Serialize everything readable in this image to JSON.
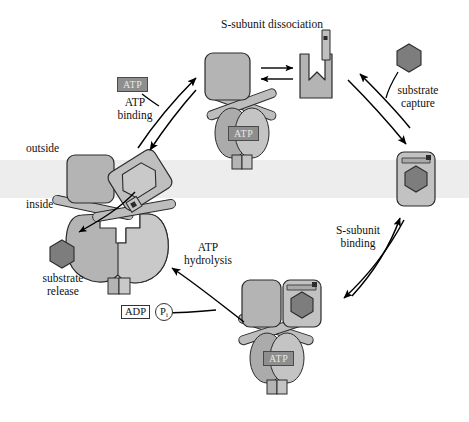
{
  "figure": {
    "title_visible": false,
    "background": "#ffffff"
  },
  "colors": {
    "protein_fill": "#b4b4b4",
    "protein_fill_light": "#c9c9c9",
    "protein_fill_dark": "#9d9d9d",
    "substrate_fill": "#808080",
    "outline": "#2b2b2b",
    "membrane_band": "#ececec",
    "atp_badge_bg": "#8e8e8e",
    "atp_badge_text": "#e8e8e8",
    "text": "#111111",
    "arrow": "#000000"
  },
  "labels": {
    "s_subunit_dissociation": "S-subunit dissociation",
    "substrate_capture_line1": "substrate",
    "substrate_capture_line2": "capture",
    "s_subunit_binding_line1": "S-subunit",
    "s_subunit_binding_line2": "binding",
    "atp_hydrolysis_line1": "ATP",
    "atp_hydrolysis_line2": "hydrolysis",
    "substrate_release_line1": "substrate",
    "substrate_release_line2": "release",
    "atp_binding_line1": "ATP",
    "atp_binding_line2": "binding",
    "outside": "outside",
    "inside": "inside"
  },
  "badges": {
    "atp_free": "ATP",
    "atp_bound_top": "ATP",
    "atp_bound_bottom": "ATP",
    "adp": "ADP",
    "pi_main": "P",
    "pi_sub": "i"
  },
  "states": [
    {
      "id": "state-top",
      "name": "transporter-with-atp-top",
      "description": "ATP-bound transporter, S-subunit dissociating",
      "has_atp": true,
      "has_substrate": false
    },
    {
      "id": "state-right",
      "name": "s-subunit-with-substrate",
      "description": "Free S-subunit bound to substrate",
      "has_atp": false,
      "has_substrate": true
    },
    {
      "id": "state-bottom",
      "name": "transporter-with-substrate-and-atp",
      "description": "Transporter with S-subunit and substrate, ATP bound",
      "has_atp": true,
      "has_substrate": true
    },
    {
      "id": "state-left",
      "name": "transporter-open-releasing-substrate",
      "description": "Open transporter releasing substrate after ATP hydrolysis",
      "has_atp": false,
      "has_substrate": false
    }
  ],
  "cycle_steps": [
    "S-subunit dissociation",
    "substrate capture",
    "S-subunit binding",
    "ATP hydrolysis",
    "substrate release",
    "ATP binding"
  ]
}
